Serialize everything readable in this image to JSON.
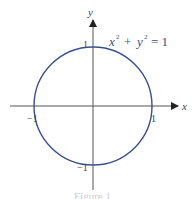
{
  "diagram": {
    "equation": {
      "base_x": "x",
      "exp": "2",
      "plus": "+",
      "base_y": "y",
      "eq": "= 1"
    },
    "axes": {
      "x_label": "x",
      "y_label": "y"
    },
    "ticks": {
      "x_pos": "1",
      "x_neg": "−1",
      "y_pos": "1",
      "y_neg": "−1"
    },
    "caption": "Figure 1",
    "colors": {
      "circle": "#3a4f8f",
      "axis": "#555555",
      "equation": "#3a4f8f"
    }
  }
}
